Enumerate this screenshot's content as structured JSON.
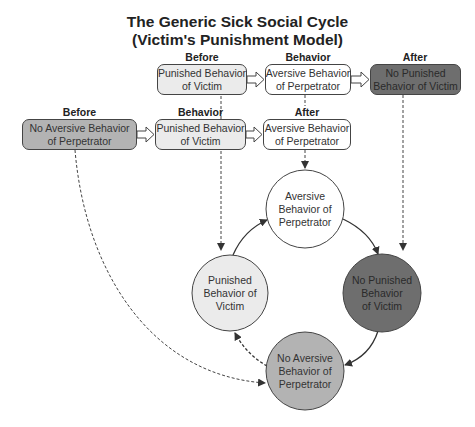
{
  "title": {
    "line1": "The Generic Sick Social Cycle",
    "line2": "(Victim's Punishment Model)"
  },
  "top_row": {
    "headers": {
      "before": "Before",
      "behavior": "Behavior",
      "after": "After"
    },
    "boxes": [
      {
        "line1": "Punished Behavior",
        "line2": "of Victim",
        "fill": "light"
      },
      {
        "line1": "Aversive Behavior",
        "line2": "of Perpetrator",
        "fill": "white"
      },
      {
        "line1": "No Punished",
        "line2": "Behavior of Victim",
        "fill": "dark"
      }
    ]
  },
  "second_row": {
    "headers": {
      "before": "Before",
      "behavior": "Behavior",
      "after": "After"
    },
    "boxes": [
      {
        "line1": "No Aversive Behavior",
        "line2": "of Perpetrator",
        "fill": "mid"
      },
      {
        "line1": "Punished Behavior",
        "line2": "of Victim",
        "fill": "light"
      },
      {
        "line1": "Aversive Behavior",
        "line2": "of Perpetrator",
        "fill": "white"
      }
    ]
  },
  "cycle": {
    "nodes": [
      {
        "id": "top",
        "line1": "Aversive",
        "line2": "Behavior of",
        "line3": "Perpetrator",
        "fill": "#ffffff"
      },
      {
        "id": "right",
        "line1": "No Punished",
        "line2": "Behavior",
        "line3": "of Victim",
        "fill": "#6e6e6e"
      },
      {
        "id": "bottom",
        "line1": "No Aversive",
        "line2": "Behavior of",
        "line3": "Perpetrator",
        "fill": "#b3b3b3"
      },
      {
        "id": "left",
        "line1": "Punished",
        "line2": "Behavior of",
        "line3": "Victim",
        "fill": "#ebebeb"
      }
    ]
  },
  "colors": {
    "light": "#ebebeb",
    "white": "#ffffff",
    "mid": "#b3b3b3",
    "dark": "#6e6e6e",
    "stroke": "#333333"
  }
}
